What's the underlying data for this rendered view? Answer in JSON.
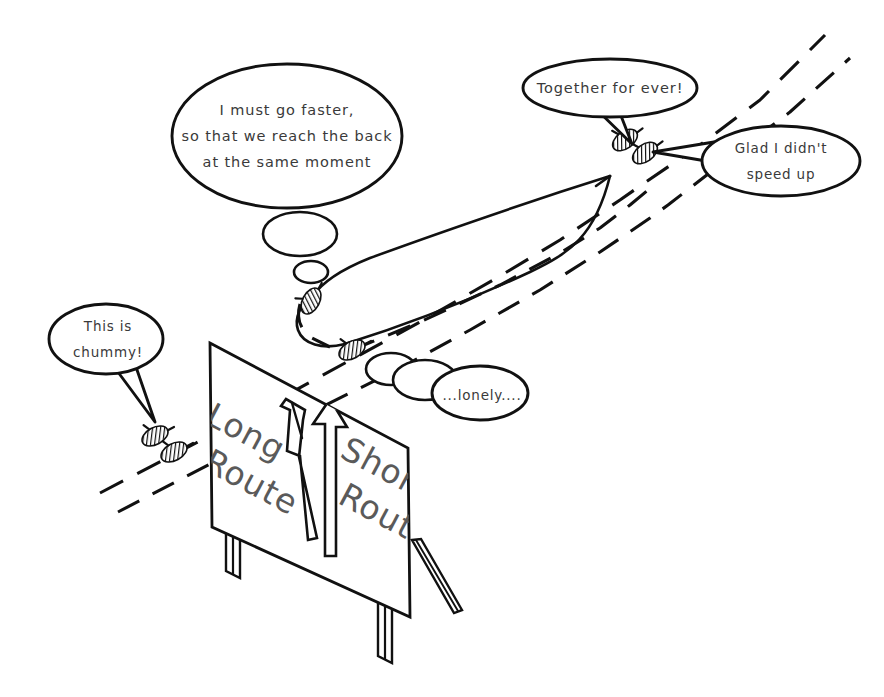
{
  "scene": {
    "title": "Long Route versus Short Route cartoon",
    "background_color": "#ffffff",
    "ink_color": "#111111",
    "sign_text_color": "#5a5a5a",
    "bubble_text_color": "#3a3a3a"
  },
  "bubbles": {
    "driver_speeding_up": {
      "type": "thought",
      "lines": [
        "I must go faster,",
        "so that we reach the back",
        "at the same moment"
      ],
      "line1": "I must go faster,",
      "line2": "so that we reach the back",
      "line3": "at the same moment"
    },
    "together_forever": {
      "type": "speech",
      "text": "Together for ever!"
    },
    "glad_not_sped_up": {
      "type": "speech",
      "text": "Glad I didn't",
      "line1": "Glad I didn't",
      "line2": "speed up"
    },
    "this_is_chummy": {
      "type": "speech",
      "line1": "This is",
      "line2": "chummy!"
    },
    "lonely": {
      "type": "thought",
      "text": "...lonely...."
    }
  },
  "sign": {
    "left_label": {
      "line1": "Long",
      "line2": "Route"
    },
    "right_label": {
      "line1": "Short",
      "line2": "Route"
    },
    "left_arrow_name": "long-route-arrow",
    "right_arrow_name": "short-route-arrow"
  },
  "vehicles": [
    {
      "id": "car-lower-left-lead",
      "label": "lead car on lower left road"
    },
    {
      "id": "car-lower-left-trail",
      "label": "trailing car on lower left road"
    },
    {
      "id": "car-long-route",
      "label": "car entering long route"
    },
    {
      "id": "car-short-route",
      "label": "car entering short route"
    },
    {
      "id": "car-upper-right-lead",
      "label": "lead car after junction"
    },
    {
      "id": "car-upper-right-trail",
      "label": "trailing car after junction"
    }
  ],
  "roads": {
    "short_route_style": "dashed",
    "long_route_style": "solid-loop"
  }
}
